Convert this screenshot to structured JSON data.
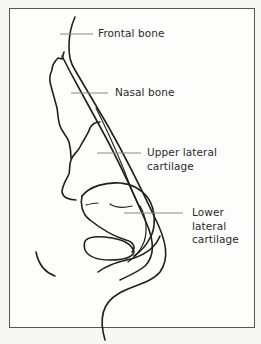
{
  "figure": {
    "type": "anatomical-diagram",
    "line_color": "#1f1f1f",
    "leader_color": "#8a8a8a"
  },
  "labels": [
    {
      "id": "frontal-bone",
      "text": "Frontal bone"
    },
    {
      "id": "nasal-bone",
      "text": "Nasal bone"
    },
    {
      "id": "upper-lateral-cartilage",
      "line1": "Upper lateral",
      "line2": "cartilage"
    },
    {
      "id": "lower-lateral-cartilage",
      "line1": "Lower",
      "line2": "lateral",
      "line3": "cartilage"
    }
  ]
}
